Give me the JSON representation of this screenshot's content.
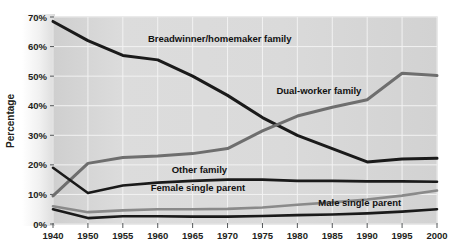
{
  "figure": {
    "name": "family-structure-line-chart",
    "background": "#ffffff",
    "plot_background": "#d9d9d9",
    "gridline_color": "#f2f2f2",
    "plot_border_color": "#bfbfbf"
  },
  "chart_data": {
    "type": "line",
    "title": "",
    "xlabel": "",
    "ylabel": "Percentage",
    "x": [
      1940,
      1950,
      1955,
      1960,
      1965,
      1970,
      1975,
      1980,
      1985,
      1990,
      1995,
      2000
    ],
    "xtick_labels": [
      "1940",
      "1950",
      "1955",
      "1960",
      "1965",
      "1970",
      "1975",
      "1980",
      "1985",
      "1990",
      "1995",
      "2000"
    ],
    "ytick_labels": [
      "0%",
      "10%",
      "20%",
      "30%",
      "40%",
      "50%",
      "60%",
      "70%"
    ],
    "yticks": [
      0,
      10,
      20,
      30,
      40,
      50,
      60,
      70
    ],
    "ylim": [
      0,
      70
    ],
    "grid": true,
    "legend": "inline-labels",
    "series": [
      {
        "name": "Breadwinner/homemaker family",
        "color": "#1a1a1a",
        "width": 3.0,
        "label_x": 1958.6,
        "label_y": 61.5,
        "label_anchor": "start",
        "values": [
          68.5,
          62.0,
          57.0,
          55.5,
          50.0,
          43.5,
          36.0,
          30.0,
          25.5,
          21.0,
          22.0,
          22.2
        ]
      },
      {
        "name": "Dual-worker family",
        "color": "#6e6e6e",
        "width": 3.0,
        "label_x": 1977.0,
        "label_y": 44.0,
        "label_anchor": "start",
        "values": [
          9.5,
          20.5,
          22.5,
          23.0,
          23.8,
          25.5,
          31.5,
          36.5,
          39.5,
          42.0,
          51.0,
          50.2
        ]
      },
      {
        "name": "Other family",
        "color": "#1a1a1a",
        "width": 2.6,
        "label_x": 1962.0,
        "label_y": 17.4,
        "label_anchor": "start",
        "values": [
          19.0,
          10.5,
          13.0,
          14.0,
          14.6,
          15.0,
          15.0,
          14.6,
          14.6,
          14.4,
          14.4,
          14.3
        ]
      },
      {
        "name": "Female single parent",
        "color": "#8a8a8a",
        "width": 2.6,
        "label_x": 1959.0,
        "label_y": 11.0,
        "label_anchor": "start",
        "values": [
          6.0,
          4.0,
          4.6,
          5.0,
          5.0,
          5.1,
          5.6,
          6.5,
          7.3,
          8.3,
          9.6,
          11.3
        ]
      },
      {
        "name": "Male single parent",
        "color": "#1a1a1a",
        "width": 2.6,
        "label_x": 1983.0,
        "label_y": 6.2,
        "label_anchor": "start",
        "values": [
          5.0,
          2.0,
          2.6,
          2.6,
          2.5,
          2.5,
          2.7,
          3.0,
          3.2,
          3.6,
          4.2,
          5.0
        ]
      }
    ]
  }
}
